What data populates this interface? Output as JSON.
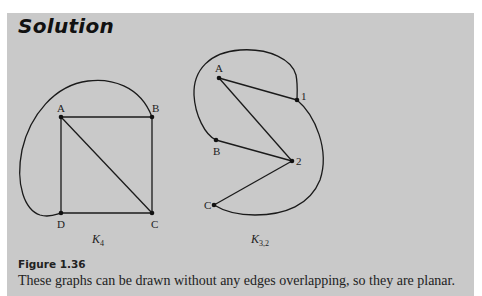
{
  "heading": "Solution",
  "figure": {
    "label": "Figure 1.36",
    "caption": "These graphs can be drawn without any edges overlapping, so they are planar."
  },
  "graphs": [
    {
      "name": "K",
      "subscript": "4",
      "nodes": [
        {
          "id": "A",
          "x": 61,
          "y": 117
        },
        {
          "id": "B",
          "x": 152,
          "y": 117
        },
        {
          "id": "C",
          "x": 152,
          "y": 213
        },
        {
          "id": "D",
          "x": 61,
          "y": 213
        }
      ],
      "edges": [
        [
          "A",
          "B"
        ],
        [
          "A",
          "D"
        ],
        [
          "B",
          "C"
        ],
        [
          "D",
          "C"
        ],
        [
          "A",
          "C"
        ],
        [
          "B",
          "D (curved)"
        ]
      ]
    },
    {
      "name": "K",
      "subscript": "3,2",
      "nodes": [
        {
          "id": "A",
          "x": 219,
          "y": 78
        },
        {
          "id": "B",
          "x": 216,
          "y": 140
        },
        {
          "id": "C",
          "x": 214,
          "y": 205
        },
        {
          "id": "1",
          "x": 297,
          "y": 100
        },
        {
          "id": "2",
          "x": 292,
          "y": 161
        }
      ],
      "edges": [
        [
          "A",
          "1"
        ],
        [
          "A",
          "2"
        ],
        [
          "B",
          "2"
        ],
        [
          "C",
          "2"
        ],
        [
          "B",
          "1 (curved)"
        ],
        [
          "C",
          "1 (curved)"
        ]
      ]
    }
  ]
}
